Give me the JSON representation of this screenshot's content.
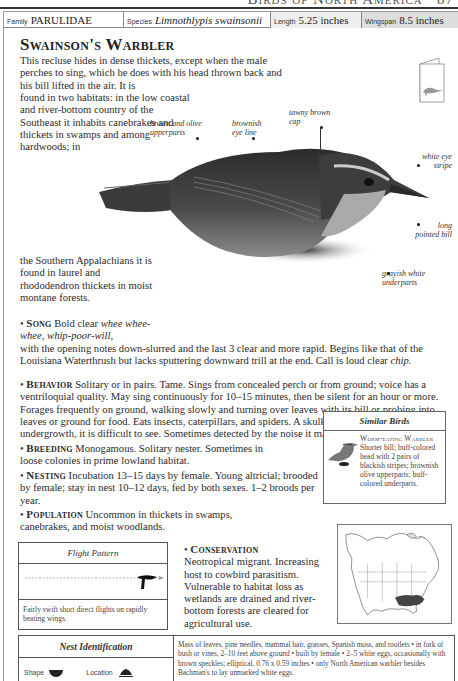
{
  "running_head": {
    "title": "Birds of North America",
    "page_number": "87"
  },
  "facts": {
    "family_label": "Family",
    "family_value": "PARULIDAE",
    "species_label": "Species",
    "species_value": "Limnothlypis swainsonii",
    "length_label": "Length",
    "length_value": "5.25 inches",
    "wingspan_label": "Wingspan",
    "wingspan_value": "8.5 inches"
  },
  "title": "Swainson's Warbler",
  "intro": {
    "part_a": "This recluse hides in dense thickets, except when the male perches to sing, which he does with his head thrown back and his bill lifted in the air. It is",
    "part_b": "found in two habitats: in the low coastal and river-bottom country of the Southeast it inhabits canebrakes and thickets in swamps and among hardwoods; in",
    "part_c": "the Southern Appalachians it is found in laurel and rhododendron thickets in moist montane forests."
  },
  "annotations": [
    {
      "id": "upperparts",
      "text": "brown and olive upperparts"
    },
    {
      "id": "eye-line",
      "text": "brownish eye line"
    },
    {
      "id": "cap",
      "text": "tawny brown cap"
    },
    {
      "id": "eye-stripe",
      "text": "white eye stripe"
    },
    {
      "id": "bill",
      "text": "long pointed bill"
    },
    {
      "id": "underparts",
      "text": "grayish white underparts"
    }
  ],
  "sections": {
    "song": {
      "heading": "Song",
      "lead": "Bold clear",
      "italic": "whee whee-whee, whip-poor-will,",
      "rest": "with the opening notes down-slurred and the last 3 clear and more rapid. Begins like that of the Louisiana Waterthrush but lacks sputtering downward trill at the end. Call is loud clear",
      "call": "chip."
    },
    "behavior": {
      "heading": "Behavior",
      "text": "Solitary or in pairs. Tame. Sings from concealed perch or from ground; voice has a ventriloquial quality. May sing continuously for 10–15 minutes, then be silent for an hour or more. Forages frequently on ground, walking slowly and turning over leaves with its bill or probing into leaves or ground for food. Eats insects, caterpillars, and spiders. A skulking bird in dense undergrowth, it is difficult to see. Sometimes detected by the noise it makes tossing leaves."
    },
    "breeding": {
      "heading": "Breeding",
      "text": "Monogamous. Solitary nester. Sometimes in loose colonies in prime lowland habitat."
    },
    "nesting": {
      "heading": "Nesting",
      "text": "Incubation 13–15 days by female. Young altricial; brooded by female; stay in nest 10–12 days, fed by both sexes. 1–2 broods per year."
    },
    "population": {
      "heading": "Population",
      "text": "Uncommon in thickets in swamps, canebrakes, and moist woodlands."
    },
    "conservation": {
      "heading": "Conservation",
      "text": "Neotropical migrant. Increasing host to cowbird parasitism. Vulnerable to habitat loss as wetlands are drained and river-bottom forests are cleared for agricultural use."
    }
  },
  "similar_birds": {
    "header": "Similar Birds",
    "name": "Worm-eating Warbler",
    "description": "Shorter bill; buff-colored head with 2 pairs of blackish stripes; brownish olive upperparts; buff-colored underparts."
  },
  "flight_pattern": {
    "header": "Flight Pattern",
    "description": "Fairly swift short direct flights on rapidly beating wings."
  },
  "nest_identification": {
    "header": "Nest Identification",
    "shape_label": "Shape",
    "location_label": "Location",
    "description": "Mass of leaves, pine needles, mammal hair, grasses, Spanish moss, and rootlets • in fork of bush or vines, 2–10 feet above ground • built by female • 2–5 white eggs, occasionally with brown speckles; elliptical, 0.76 x 0.59 inches • only North American warbler besides Bachman's to lay unmarked white eggs."
  },
  "colors": {
    "length_cell_bg": "#eeeeee",
    "wingspan_cell_bg": "#dddddd",
    "range_fill": "#444444"
  }
}
